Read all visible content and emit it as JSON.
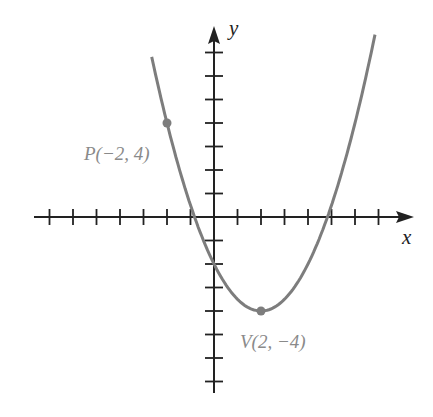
{
  "chart_data": {
    "type": "line",
    "title": "",
    "xlabel": "x",
    "ylabel": "y",
    "function": "y = 0.5(x - 2)^2 - 4",
    "xlim": [
      -7.5,
      8.5
    ],
    "ylim": [
      -7.5,
      8
    ],
    "x_ticks": [
      -7,
      -6,
      -5,
      -4,
      -3,
      -2,
      -1,
      1,
      2,
      3,
      4,
      5,
      6,
      7
    ],
    "y_ticks": [
      -7,
      -6,
      -5,
      -4,
      -3,
      -2,
      -1,
      1,
      2,
      3,
      4,
      5,
      6,
      7
    ],
    "tick_labels_shown": false,
    "grid": false,
    "curve_x_range": [
      -2.65,
      6.85
    ],
    "series": [
      {
        "name": "parabola",
        "color": "#7d7d7d",
        "x": [
          -2.65,
          -2,
          -1,
          0,
          1,
          2,
          3,
          4,
          5,
          6,
          6.85
        ],
        "y": [
          6.81,
          4,
          0.5,
          -2,
          -3.5,
          -4,
          -3.5,
          -2,
          0.5,
          4,
          7.76
        ]
      }
    ],
    "points": [
      {
        "name": "P",
        "x": -2,
        "y": 4,
        "label": "P(−2, 4)"
      },
      {
        "name": "V",
        "x": 2,
        "y": -4,
        "label": "V(2,  −4)"
      }
    ],
    "annotations": [
      "P(−2, 4)",
      "V(2,  −4)"
    ]
  },
  "labels": {
    "x_axis": "x",
    "y_axis": "y",
    "point_p": "P(−2, 4)",
    "point_v": "V(2,  −4)"
  },
  "colors": {
    "axis": "#222222",
    "curve": "#7d7d7d",
    "point": "#7d7d7d",
    "label": "#8a8a8a"
  }
}
